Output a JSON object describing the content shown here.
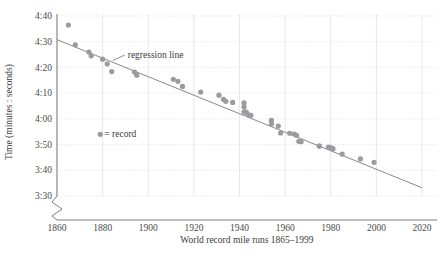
{
  "chart_data": {
    "type": "scatter",
    "title": "",
    "xlabel": "World record mile runs 1865–1999",
    "ylabel": "Time (minutes : seconds)",
    "xlim": [
      1857,
      2022
    ],
    "ylim_seconds": [
      210,
      280
    ],
    "xticks": [
      1860,
      1880,
      1900,
      1920,
      1940,
      1960,
      1980,
      2000,
      2020
    ],
    "xtick_labels": [
      "1860",
      "1880",
      "1900",
      "1920",
      "1940",
      "1960",
      "1980",
      "2000",
      "2020"
    ],
    "yticks_seconds": [
      280,
      270,
      260,
      250,
      240,
      230,
      220,
      210
    ],
    "ytick_labels": [
      "4:40",
      "4:30",
      "4:20",
      "4:10",
      "4:00",
      "3:50",
      "3:40",
      "3:30"
    ],
    "grid": true,
    "axis_break": true,
    "legend_position": "inside-left",
    "series": [
      {
        "name": "record",
        "marker": "circle",
        "color": "#9a9aa0",
        "points": [
          {
            "x": 1865,
            "y_seconds": 276.5,
            "label": "4:36.5"
          },
          {
            "x": 1868,
            "y_seconds": 268.8,
            "label": "4:28.8"
          },
          {
            "x": 1874,
            "y_seconds": 266.0,
            "label": "4:26.0"
          },
          {
            "x": 1875,
            "y_seconds": 264.5,
            "label": "4:24.5"
          },
          {
            "x": 1880,
            "y_seconds": 263.2,
            "label": "4:23.2"
          },
          {
            "x": 1882,
            "y_seconds": 261.4,
            "label": "4:21.4"
          },
          {
            "x": 1884,
            "y_seconds": 258.4,
            "label": "4:18.4"
          },
          {
            "x": 1894,
            "y_seconds": 258.2,
            "label": "4:18.2"
          },
          {
            "x": 1895,
            "y_seconds": 257.0,
            "label": "4:17.0"
          },
          {
            "x": 1911,
            "y_seconds": 255.4,
            "label": "4:15.4"
          },
          {
            "x": 1913,
            "y_seconds": 254.6,
            "label": "4:14.6"
          },
          {
            "x": 1915,
            "y_seconds": 252.6,
            "label": "4:12.6"
          },
          {
            "x": 1923,
            "y_seconds": 250.4,
            "label": "4:10.4"
          },
          {
            "x": 1931,
            "y_seconds": 249.2,
            "label": "4:09.2"
          },
          {
            "x": 1933,
            "y_seconds": 247.6,
            "label": "4:07.6"
          },
          {
            "x": 1934,
            "y_seconds": 246.8,
            "label": "4:06.8"
          },
          {
            "x": 1937,
            "y_seconds": 246.4,
            "label": "4:06.4"
          },
          {
            "x": 1942,
            "y_seconds": 246.2,
            "label": "4:06.2"
          },
          {
            "x": 1942,
            "y_seconds": 244.6,
            "label": "4:04.6"
          },
          {
            "x": 1942,
            "y_seconds": 242.6,
            "label": "4:02.6"
          },
          {
            "x": 1943,
            "y_seconds": 242.6,
            "label": "4:02.6"
          },
          {
            "x": 1944,
            "y_seconds": 241.6,
            "label": "4:01.6"
          },
          {
            "x": 1945,
            "y_seconds": 241.4,
            "label": "4:01.4"
          },
          {
            "x": 1954,
            "y_seconds": 239.4,
            "label": "3:59.4"
          },
          {
            "x": 1954,
            "y_seconds": 238.0,
            "label": "3:58.0"
          },
          {
            "x": 1957,
            "y_seconds": 237.2,
            "label": "3:57.2"
          },
          {
            "x": 1958,
            "y_seconds": 234.5,
            "label": "3:54.5"
          },
          {
            "x": 1962,
            "y_seconds": 234.4,
            "label": "3:54.4"
          },
          {
            "x": 1964,
            "y_seconds": 234.1,
            "label": "3:54.1"
          },
          {
            "x": 1965,
            "y_seconds": 233.6,
            "label": "3:53.6"
          },
          {
            "x": 1966,
            "y_seconds": 231.3,
            "label": "3:51.3"
          },
          {
            "x": 1967,
            "y_seconds": 231.1,
            "label": "3:51.1"
          },
          {
            "x": 1975,
            "y_seconds": 229.4,
            "label": "3:49.4"
          },
          {
            "x": 1975,
            "y_seconds": 229.4,
            "label": "3:49.4"
          },
          {
            "x": 1979,
            "y_seconds": 229.0,
            "label": "3:49.0"
          },
          {
            "x": 1980,
            "y_seconds": 228.8,
            "label": "3:48.8"
          },
          {
            "x": 1981,
            "y_seconds": 228.4,
            "label": "3:48.4"
          },
          {
            "x": 1985,
            "y_seconds": 226.3,
            "label": "3:46.3"
          },
          {
            "x": 1993,
            "y_seconds": 224.4,
            "label": "3:44.4"
          },
          {
            "x": 1999,
            "y_seconds": 223.1,
            "label": "3:43.1"
          }
        ]
      }
    ],
    "regression_line": {
      "name": "regression line",
      "color": "#7a7a80",
      "x_start": 1860,
      "y_start_seconds": 270.8,
      "x_end": 2020,
      "y_end_seconds": 213.2
    },
    "annotations": [
      {
        "name": "regression-line-label",
        "text": "regression line",
        "x": 1891,
        "y_seconds": 265.0
      },
      {
        "name": "legend-record",
        "text": "= record",
        "x": 1879,
        "y_seconds": 234.0
      }
    ]
  },
  "axis": {
    "y_title": "Time (minutes : seconds)",
    "x_title": "World record mile runs 1865–1999"
  },
  "legend": {
    "marker_name": "record-dot-icon",
    "label": "= record"
  },
  "annotation": {
    "regression_label": "regression line"
  },
  "colors": {
    "point": "#9a9aa0",
    "line": "#7a7a80",
    "grid": "#d9d9dd",
    "axis": "#6f6f74",
    "text": "#3b3b3b"
  }
}
